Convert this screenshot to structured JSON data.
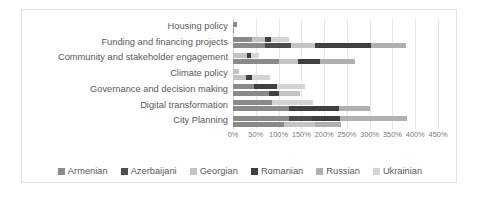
{
  "chart_data": {
    "type": "bar",
    "orientation": "horizontal",
    "stacked": true,
    "title": "",
    "subtitle": "",
    "xlabel": "",
    "ylabel": "",
    "xlim": [
      0,
      450
    ],
    "grid": true,
    "legend_position": "bottom",
    "tick_labels": [
      "0%",
      "50%",
      "100%",
      "150%",
      "200%",
      "250%",
      "300%",
      "350%",
      "400%",
      "450%"
    ],
    "tick_values": [
      0,
      50,
      100,
      150,
      200,
      250,
      300,
      350,
      400,
      450
    ],
    "categories": [
      "Housing policy",
      "Funding and financing projects",
      "Community and stakeholder engagement",
      "Climate policy",
      "Governance and decision making",
      "Digital transformation",
      "City Planning"
    ],
    "series": [
      {
        "name": "Armenian",
        "color": "#8a8a8a",
        "values": [
          4,
          45,
          30,
          10,
          40,
          60,
          62
        ]
      },
      {
        "name": "Azerbaijani",
        "color": "#4d4d4d",
        "values": [
          0,
          20,
          8,
          6,
          30,
          30,
          32
        ]
      },
      {
        "name": "Georgian",
        "color": "#c4c4c4",
        "values": [
          2,
          28,
          12,
          10,
          30,
          35,
          40
        ]
      },
      {
        "name": "Romanian",
        "color": "#3f3f3f",
        "values": [
          0,
          50,
          25,
          4,
          20,
          52,
          48
        ]
      },
      {
        "name": "Russian",
        "color": "#b0b0b0",
        "values": [
          0,
          180,
          130,
          20,
          20,
          90,
          140
        ]
      },
      {
        "name": "Ukrainian",
        "color": "#d4d4d4",
        "values": [
          0,
          52,
          50,
          8,
          12,
          18,
          58
        ]
      }
    ],
    "bars": [
      {
        "category": "Housing policy",
        "group": 0,
        "segments": [
          {
            "series": "Armenian",
            "value": 8
          }
        ]
      },
      {
        "category": "Housing policy",
        "group": 1,
        "segments": [
          {
            "series": "Armenian",
            "value": 3
          }
        ]
      },
      {
        "category": "Funding and financing projects",
        "group": 0,
        "segments": [
          {
            "series": "Armenian",
            "value": 42
          },
          {
            "series": "Georgian",
            "value": 28
          },
          {
            "series": "Romanian",
            "value": 14
          },
          {
            "series": "Ukrainian",
            "value": 38
          }
        ]
      },
      {
        "category": "Funding and financing projects",
        "group": 1,
        "segments": [
          {
            "series": "Armenian",
            "value": 70
          },
          {
            "series": "Azerbaijani",
            "value": 58
          },
          {
            "series": "Georgian",
            "value": 52
          },
          {
            "series": "Romanian",
            "value": 122
          },
          {
            "series": "Russian",
            "value": 78
          }
        ]
      },
      {
        "category": "Community and stakeholder engagement",
        "group": 0,
        "segments": [
          {
            "series": "Georgian",
            "value": 30
          },
          {
            "series": "Romanian",
            "value": 10
          },
          {
            "series": "Ukrainian",
            "value": 18
          }
        ]
      },
      {
        "category": "Community and stakeholder engagement",
        "group": 1,
        "segments": [
          {
            "series": "Armenian",
            "value": 100
          },
          {
            "series": "Georgian",
            "value": 42
          },
          {
            "series": "Romanian",
            "value": 50
          },
          {
            "series": "Russian",
            "value": 75
          }
        ]
      },
      {
        "category": "Climate policy",
        "group": 0,
        "segments": [
          {
            "series": "Georgian",
            "value": 14
          }
        ]
      },
      {
        "category": "Climate policy",
        "group": 1,
        "segments": [
          {
            "series": "Georgian",
            "value": 28
          },
          {
            "series": "Romanian",
            "value": 14
          },
          {
            "series": "Ukrainian",
            "value": 40
          }
        ]
      },
      {
        "category": "Governance and decision making",
        "group": 0,
        "segments": [
          {
            "series": "Armenian",
            "value": 46
          },
          {
            "series": "Romanian",
            "value": 50
          },
          {
            "series": "Ukrainian",
            "value": 62
          }
        ]
      },
      {
        "category": "Governance and decision making",
        "group": 1,
        "segments": [
          {
            "series": "Armenian",
            "value": 80
          },
          {
            "series": "Romanian",
            "value": 20
          },
          {
            "series": "Georgian",
            "value": 46
          }
        ]
      },
      {
        "category": "Digital transformation",
        "group": 0,
        "segments": [
          {
            "series": "Armenian",
            "value": 86
          },
          {
            "series": "Ukrainian",
            "value": 90
          }
        ]
      },
      {
        "category": "Digital transformation",
        "group": 1,
        "segments": [
          {
            "series": "Armenian",
            "value": 122
          },
          {
            "series": "Romanian",
            "value": 110
          },
          {
            "series": "Russian",
            "value": 68
          }
        ]
      },
      {
        "category": "City Planning",
        "group": 0,
        "segments": [
          {
            "series": "Armenian",
            "value": 122
          },
          {
            "series": "Azerbaijani",
            "value": 52
          },
          {
            "series": "Romanian",
            "value": 60
          },
          {
            "series": "Russian",
            "value": 148
          }
        ]
      },
      {
        "category": "City Planning",
        "group": 1,
        "segments": [
          {
            "series": "Armenian",
            "value": 112
          },
          {
            "series": "Georgian",
            "value": 68
          },
          {
            "series": "Russian",
            "value": 58
          }
        ]
      }
    ]
  },
  "legend": {
    "items": [
      {
        "label": "Armenian",
        "color": "#8a8a8a"
      },
      {
        "label": "Azerbaijani",
        "color": "#4d4d4d"
      },
      {
        "label": "Georgian",
        "color": "#c4c4c4"
      },
      {
        "label": "Romanian",
        "color": "#3f3f3f"
      },
      {
        "label": "Russian",
        "color": "#b0b0b0"
      },
      {
        "label": "Ukrainian",
        "color": "#d4d4d4"
      }
    ]
  }
}
